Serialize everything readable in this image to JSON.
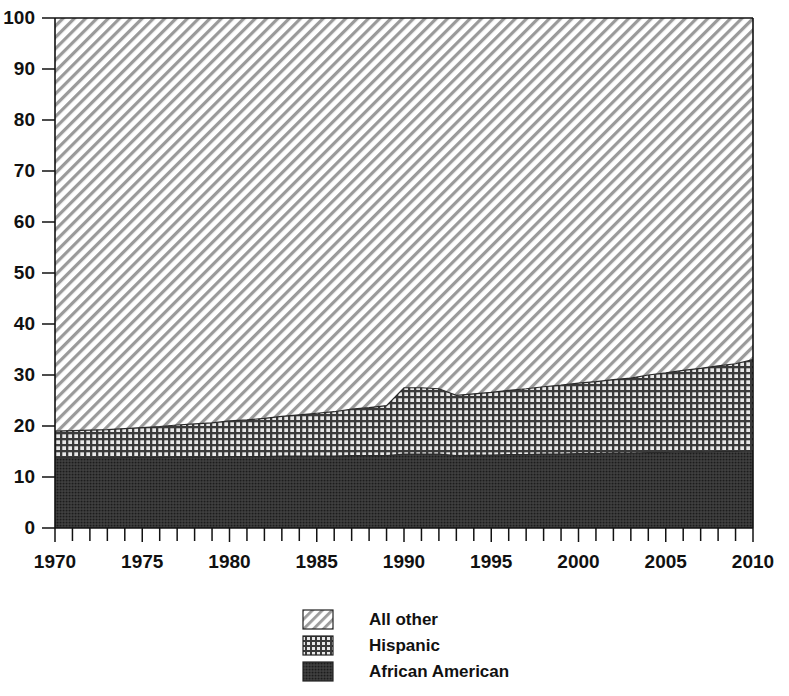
{
  "chart_data": {
    "type": "area",
    "stacked": true,
    "title": "",
    "subtitle": "",
    "xlabel": "",
    "ylabel": "",
    "xlim": [
      1970,
      2010
    ],
    "ylim": [
      0,
      100
    ],
    "grid": false,
    "legend_position": "bottom-center",
    "x_tick_labels": [
      "1970",
      "1975",
      "1980",
      "1985",
      "1990",
      "1995",
      "2000",
      "2005",
      "2010"
    ],
    "x_tick_values": [
      1970,
      1975,
      1980,
      1985,
      1990,
      1995,
      2000,
      2005,
      2010
    ],
    "x_minor_tick_step": 1,
    "y_tick_labels": [
      "0",
      "10",
      "20",
      "30",
      "40",
      "50",
      "60",
      "70",
      "80",
      "90",
      "100"
    ],
    "y_tick_values": [
      0,
      10,
      20,
      30,
      40,
      50,
      60,
      70,
      80,
      90,
      100
    ],
    "x": [
      1970,
      1971,
      1972,
      1973,
      1974,
      1975,
      1976,
      1977,
      1978,
      1979,
      1980,
      1981,
      1982,
      1983,
      1984,
      1985,
      1986,
      1987,
      1988,
      1989,
      1990,
      1991,
      1992,
      1993,
      1994,
      1995,
      1996,
      1997,
      1998,
      1999,
      2000,
      2001,
      2002,
      2003,
      2004,
      2005,
      2006,
      2007,
      2008,
      2009,
      2010
    ],
    "series": [
      {
        "name": "African American",
        "pattern": "dense-dark",
        "color": "#2b2b2b",
        "values": [
          13.7,
          13.7,
          13.7,
          13.7,
          13.8,
          13.8,
          13.8,
          13.9,
          13.9,
          13.9,
          14.0,
          14.0,
          14.0,
          14.1,
          14.1,
          14.1,
          14.1,
          14.2,
          14.2,
          14.2,
          14.5,
          14.5,
          14.5,
          14.2,
          14.3,
          14.3,
          14.4,
          14.4,
          14.5,
          14.5,
          14.6,
          14.6,
          14.7,
          14.7,
          14.8,
          14.8,
          14.9,
          14.9,
          15.0,
          15.0,
          15.1
        ]
      },
      {
        "name": "Hispanic",
        "pattern": "cross-grid",
        "color": "#808080",
        "values": [
          5.3,
          5.4,
          5.5,
          5.6,
          5.7,
          5.9,
          6.1,
          6.3,
          6.5,
          6.7,
          7.0,
          7.2,
          7.5,
          7.8,
          8.1,
          8.4,
          8.7,
          9.1,
          9.4,
          9.8,
          13.0,
          13.0,
          12.8,
          11.8,
          12.0,
          12.3,
          12.6,
          12.9,
          13.2,
          13.5,
          13.8,
          14.1,
          14.4,
          14.7,
          15.2,
          15.6,
          16.0,
          16.4,
          16.8,
          17.2,
          17.9
        ]
      },
      {
        "name": "All other",
        "pattern": "diagonal-hatch",
        "color": "#d9d9d9",
        "values": [
          81.0,
          80.9,
          80.8,
          80.7,
          80.5,
          80.3,
          80.1,
          79.8,
          79.6,
          79.4,
          79.0,
          78.8,
          78.5,
          78.1,
          77.8,
          77.5,
          77.2,
          76.7,
          76.4,
          76.0,
          72.5,
          72.5,
          72.7,
          74.0,
          73.7,
          73.4,
          73.0,
          72.7,
          72.3,
          72.0,
          71.6,
          71.3,
          70.9,
          70.6,
          70.0,
          69.6,
          69.1,
          68.7,
          68.2,
          67.8,
          67.0
        ]
      }
    ],
    "cumulative_top_boundaries": {
      "african_american_top": [
        13.7,
        13.7,
        13.7,
        13.7,
        13.8,
        13.8,
        13.8,
        13.9,
        13.9,
        13.9,
        14.0,
        14.0,
        14.0,
        14.1,
        14.1,
        14.1,
        14.1,
        14.2,
        14.2,
        14.2,
        14.5,
        14.5,
        14.5,
        14.2,
        14.3,
        14.3,
        14.4,
        14.4,
        14.5,
        14.5,
        14.6,
        14.6,
        14.7,
        14.7,
        14.8,
        14.8,
        14.9,
        14.9,
        15.0,
        15.0,
        15.1
      ],
      "hispanic_top": [
        19.0,
        19.1,
        19.2,
        19.3,
        19.5,
        19.7,
        19.9,
        20.2,
        20.4,
        20.6,
        21.0,
        21.2,
        21.5,
        21.9,
        22.2,
        22.5,
        22.8,
        23.3,
        23.6,
        24.0,
        27.5,
        27.5,
        27.3,
        26.0,
        26.3,
        26.6,
        27.0,
        27.3,
        27.7,
        28.0,
        28.4,
        28.7,
        29.1,
        29.4,
        30.0,
        30.4,
        30.9,
        31.3,
        31.8,
        32.2,
        33.0
      ]
    },
    "legend": [
      {
        "label": "All other",
        "pattern": "diagonal-hatch"
      },
      {
        "label": "Hispanic",
        "pattern": "cross-grid"
      },
      {
        "label": "African American",
        "pattern": "dense-dark"
      }
    ]
  }
}
